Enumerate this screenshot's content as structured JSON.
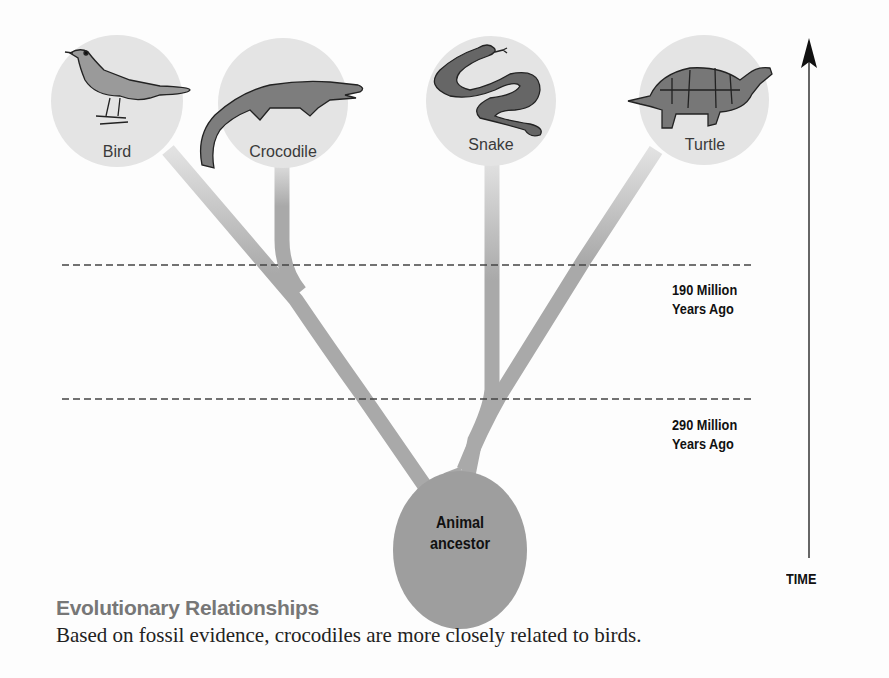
{
  "diagram": {
    "type": "evolutionary-tree",
    "taxa": [
      {
        "name": "Bird",
        "icon": "bird-icon"
      },
      {
        "name": "Crocodile",
        "icon": "crocodile-icon"
      },
      {
        "name": "Snake",
        "icon": "snake-icon"
      },
      {
        "name": "Turtle",
        "icon": "turtle-icon"
      }
    ],
    "root": {
      "line1": "Animal",
      "line2": "ancestor"
    },
    "time_markers": [
      {
        "line1": "190 Million",
        "line2": "Years Ago"
      },
      {
        "line1": "290 Million",
        "line2": "Years Ago"
      }
    ],
    "axis_label": "TIME",
    "colors": {
      "branch": "#a9a9a9",
      "taxon_circle": "#e4e4e4",
      "root_circle": "#9e9e9e",
      "animal_fill": "#8c8c8c"
    }
  },
  "caption": {
    "title": "Evolutionary Relationships",
    "text": "Based on fossil evidence, crocodiles are more closely related to birds."
  }
}
